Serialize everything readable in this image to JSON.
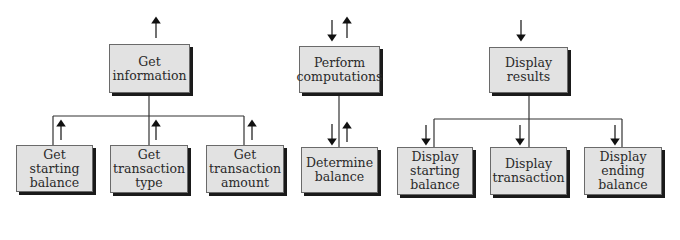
{
  "diagram": {
    "type": "structure-chart",
    "modules": [
      {
        "id": "get_info",
        "label": "Get\ninformation"
      },
      {
        "id": "get_start",
        "label": "Get\nstarting\nbalance"
      },
      {
        "id": "get_type",
        "label": "Get\ntransaction\ntype"
      },
      {
        "id": "get_amount",
        "label": "Get\ntransaction\namount"
      },
      {
        "id": "perform",
        "label": "Perform\ncomputations"
      },
      {
        "id": "determine",
        "label": "Determine\nbalance"
      },
      {
        "id": "display",
        "label": "Display\nresults"
      },
      {
        "id": "disp_start",
        "label": "Display\nstarting\nbalance"
      },
      {
        "id": "disp_trans",
        "label": "Display\ntransaction"
      },
      {
        "id": "disp_end",
        "label": "Display\nending\nbalance"
      }
    ],
    "edges": [
      {
        "from": "get_info",
        "to": "get_start",
        "flow": "up"
      },
      {
        "from": "get_info",
        "to": "get_type",
        "flow": "up"
      },
      {
        "from": "get_info",
        "to": "get_amount",
        "flow": "up"
      },
      {
        "from": "perform",
        "to": "determine",
        "flow": "down-up"
      },
      {
        "from": "display",
        "to": "disp_start",
        "flow": "down"
      },
      {
        "from": "display",
        "to": "disp_trans",
        "flow": "down"
      },
      {
        "from": "display",
        "to": "disp_end",
        "flow": "down"
      }
    ],
    "top_flows": {
      "get_info": "up",
      "perform": "down-up",
      "display": "down"
    },
    "colors": {
      "box_fill": "#e2e2e2",
      "shadow": "#1a1a1a",
      "line": "#333333"
    }
  }
}
